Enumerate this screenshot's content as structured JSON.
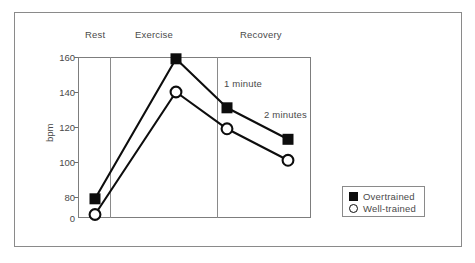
{
  "chart_data": {
    "type": "line",
    "title": "",
    "xlabel": "",
    "ylabel": "bpm",
    "grid": false,
    "legend_position": "bottom-right",
    "ylim": [
      0,
      160
    ],
    "y_axis_break": true,
    "y_ticks": [
      "0",
      "80",
      "100",
      "120",
      "140",
      "160"
    ],
    "categories": [
      "Rest",
      "Exercise",
      "1 minute",
      "2 minutes"
    ],
    "phase_labels": [
      "Rest",
      "Exercise",
      "Recovery"
    ],
    "annotations": [
      "1 minute",
      "2 minutes"
    ],
    "series": [
      {
        "name": "Overtrained",
        "marker": "filled-square",
        "values": [
          79,
          159,
          131,
          113
        ]
      },
      {
        "name": "Well-trained",
        "marker": "open-circle",
        "values": [
          70,
          140,
          119,
          101
        ]
      }
    ],
    "colors": {
      "line": "#0d0d0d",
      "axis": "#7d7d7d",
      "text": "#4a4a4a",
      "background": "#ffffff"
    }
  },
  "axis": {
    "y_title": "bpm",
    "ticks": {
      "t0": "0",
      "t80": "80",
      "t100": "100",
      "t120": "120",
      "t140": "140",
      "t160": "160"
    }
  },
  "phases": {
    "rest": "Rest",
    "exercise": "Exercise",
    "recovery": "Recovery"
  },
  "annotations": {
    "one_minute": "1 minute",
    "two_minutes": "2 minutes"
  },
  "legend": {
    "overtrained": "Overtrained",
    "well_trained": "Well-trained"
  }
}
